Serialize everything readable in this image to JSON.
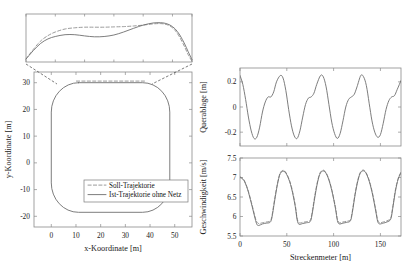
{
  "figure": {
    "title": "",
    "background": "#ffffff",
    "line_color_actual": "#6e6e6e",
    "line_color_reference": "#8f8f8f",
    "axis_color": "#8a8a8a"
  },
  "legend": {
    "entries": [
      {
        "label": "Soll-Trajektorie",
        "style": "dashed"
      },
      {
        "label": "Ist-Trajektorie ohne Netz",
        "style": "solid"
      }
    ]
  },
  "chart_data": [
    {
      "id": "inset-detail",
      "type": "line",
      "title": "",
      "xlabel": "",
      "ylabel": "",
      "xlim": [
        8,
        42
      ],
      "ylim": [
        29.2,
        30.8
      ],
      "grid": false,
      "ticks_visible": false,
      "xticks": [
        8,
        14,
        20,
        26,
        32,
        38,
        42
      ],
      "yticks": [],
      "series": [
        {
          "name": "Soll-Trajektorie",
          "style": "dashed",
          "x": [
            8.0,
            9.5,
            11.0,
            12.5,
            14.0,
            16.0,
            18.0,
            20.0,
            22.0,
            24.0,
            26.0,
            28.0,
            30.0,
            32.0,
            34.0,
            35.5,
            36.5,
            37.5,
            38.5,
            39.5,
            40.5,
            41.2,
            42.0
          ],
          "y": [
            29.3,
            29.62,
            29.9,
            30.08,
            30.2,
            30.3,
            30.34,
            30.36,
            30.36,
            30.36,
            30.37,
            30.38,
            30.4,
            30.43,
            30.47,
            30.48,
            30.46,
            30.4,
            30.26,
            30.02,
            29.7,
            29.45,
            29.22
          ]
        },
        {
          "name": "Ist-Trajektorie ohne Netz",
          "style": "solid",
          "x": [
            8.0,
            9.5,
            11.0,
            12.5,
            14.0,
            16.0,
            18.0,
            20.0,
            22.0,
            24.0,
            26.0,
            28.0,
            30.0,
            32.0,
            34.0,
            35.5,
            36.5,
            37.5,
            38.5,
            39.5,
            40.5,
            41.2,
            42.0
          ],
          "y": [
            29.3,
            29.58,
            29.82,
            29.97,
            30.05,
            30.11,
            30.11,
            30.07,
            30.04,
            30.05,
            30.1,
            30.2,
            30.32,
            30.43,
            30.5,
            30.51,
            30.49,
            30.43,
            30.31,
            30.1,
            29.8,
            29.55,
            29.28
          ]
        }
      ]
    },
    {
      "id": "trajectory-xy",
      "type": "line",
      "title": "",
      "xlabel": "x-Koordinate [m]",
      "ylabel": "y-Koordinate [m]",
      "xlim": [
        -7,
        57
      ],
      "ylim": [
        -24,
        34
      ],
      "grid": false,
      "xticks": [
        0,
        10,
        20,
        30,
        40,
        50
      ],
      "yticks": [
        -20,
        -10,
        0,
        10,
        20,
        30
      ],
      "track": {
        "shape": "rounded-rectangle",
        "x_min": 0.0,
        "x_max": 48.0,
        "y_min": -18.5,
        "y_max": 30.0,
        "corner_radius": 11.0
      },
      "series": [
        {
          "name": "Soll-Trajektorie",
          "style": "dashed",
          "note": "reference path, visible mainly along the top straight near y=30"
        },
        {
          "name": "Ist-Trajektorie ohne Netz",
          "style": "solid",
          "note": "closed oval lap traversed by the vehicle"
        }
      ]
    },
    {
      "id": "querablage",
      "type": "line",
      "title": "",
      "xlabel": "",
      "ylabel": "Querablage [m]",
      "xlim": [
        0,
        172
      ],
      "ylim": [
        -0.31,
        0.31
      ],
      "grid": false,
      "xticks": [
        0,
        50,
        100,
        150
      ],
      "yticks": [
        -0.2,
        0,
        0.2
      ],
      "ytick_labels": [
        "-0.2",
        "0",
        "0.2"
      ],
      "cycles": 4,
      "period": 43,
      "series": [
        {
          "name": "Querablage",
          "style": "solid",
          "x": [
            0,
            3,
            6,
            9,
            12,
            15,
            18,
            21,
            24,
            27,
            30,
            33,
            36,
            39,
            43,
            46,
            49,
            52,
            55,
            58,
            61,
            64,
            67,
            70,
            73,
            76,
            79,
            82,
            86,
            89,
            92,
            95,
            98,
            101,
            104,
            107,
            110,
            113,
            116,
            119,
            122,
            125,
            129,
            132,
            135,
            138,
            141,
            144,
            147,
            150,
            153,
            156,
            159,
            162,
            165,
            168,
            172
          ],
          "y": [
            0.25,
            0.18,
            0.06,
            -0.08,
            -0.19,
            -0.25,
            -0.24,
            -0.16,
            -0.04,
            0.04,
            0.08,
            0.08,
            0.12,
            0.2,
            0.25,
            0.23,
            0.13,
            -0.02,
            -0.15,
            -0.23,
            -0.25,
            -0.19,
            -0.08,
            0.02,
            0.07,
            0.08,
            0.11,
            0.18,
            0.25,
            0.24,
            0.16,
            0.02,
            -0.12,
            -0.21,
            -0.25,
            -0.21,
            -0.11,
            0.0,
            0.06,
            0.08,
            0.1,
            0.16,
            0.25,
            0.24,
            0.17,
            0.03,
            -0.11,
            -0.2,
            -0.24,
            -0.22,
            -0.13,
            -0.02,
            0.05,
            0.08,
            0.09,
            0.14,
            0.21
          ]
        }
      ]
    },
    {
      "id": "geschwindigkeit",
      "type": "line",
      "title": "",
      "xlabel": "Streckenmeter [m]",
      "ylabel": "Geschwindigkeit [m/s]",
      "xlim": [
        0,
        172
      ],
      "ylim": [
        5.5,
        7.5
      ],
      "grid": false,
      "xticks": [
        0,
        50,
        100,
        150
      ],
      "yticks": [
        5.5,
        6,
        6.5,
        7,
        7.5
      ],
      "ytick_labels": [
        "5.5",
        "6",
        "6.5",
        "7",
        "7.5"
      ],
      "cycles": 4,
      "period": 43,
      "series": [
        {
          "name": "Soll-Trajektorie",
          "style": "dashed",
          "x": [
            0,
            4,
            8,
            12,
            16,
            18,
            20,
            24,
            28,
            32,
            34,
            37,
            40,
            43,
            47,
            51,
            55,
            59,
            61,
            63,
            67,
            71,
            75,
            77,
            80,
            83,
            86,
            90,
            94,
            98,
            102,
            104,
            106,
            110,
            114,
            118,
            120,
            123,
            126,
            129,
            133,
            137,
            141,
            145,
            147,
            149,
            153,
            157,
            161,
            163,
            166,
            169,
            172
          ],
          "y": [
            7.02,
            6.95,
            6.72,
            6.38,
            6.0,
            5.86,
            5.82,
            5.84,
            5.86,
            5.88,
            6.0,
            6.45,
            6.85,
            7.12,
            7.18,
            7.04,
            6.76,
            6.3,
            5.96,
            5.84,
            5.85,
            5.87,
            5.9,
            6.1,
            6.55,
            6.92,
            7.14,
            7.18,
            7.02,
            6.7,
            6.24,
            5.94,
            5.84,
            5.86,
            5.88,
            5.92,
            6.14,
            6.6,
            6.95,
            7.15,
            7.18,
            7.0,
            6.66,
            6.18,
            5.92,
            5.84,
            5.86,
            5.89,
            5.96,
            6.22,
            6.68,
            6.98,
            7.14
          ]
        },
        {
          "name": "Ist-Trajektorie ohne Netz",
          "style": "solid",
          "x": [
            0,
            4,
            8,
            12,
            16,
            18,
            20,
            24,
            28,
            32,
            34,
            37,
            40,
            43,
            47,
            51,
            55,
            59,
            61,
            63,
            67,
            71,
            75,
            77,
            80,
            83,
            86,
            90,
            94,
            98,
            102,
            104,
            106,
            110,
            114,
            118,
            120,
            123,
            126,
            129,
            133,
            137,
            141,
            145,
            147,
            149,
            153,
            157,
            161,
            163,
            166,
            169,
            172
          ],
          "y": [
            7.0,
            6.93,
            6.7,
            6.35,
            5.96,
            5.8,
            5.77,
            5.81,
            5.83,
            5.85,
            5.96,
            6.4,
            6.82,
            7.1,
            7.16,
            7.02,
            6.73,
            6.26,
            5.92,
            5.8,
            5.82,
            5.84,
            5.87,
            6.05,
            6.5,
            6.89,
            7.12,
            7.16,
            7.0,
            6.67,
            6.2,
            5.9,
            5.81,
            5.83,
            5.85,
            5.89,
            6.1,
            6.56,
            6.92,
            7.13,
            7.16,
            6.98,
            6.63,
            6.14,
            5.88,
            5.81,
            5.83,
            5.86,
            5.93,
            6.18,
            6.64,
            6.96,
            7.12
          ]
        }
      ]
    }
  ]
}
